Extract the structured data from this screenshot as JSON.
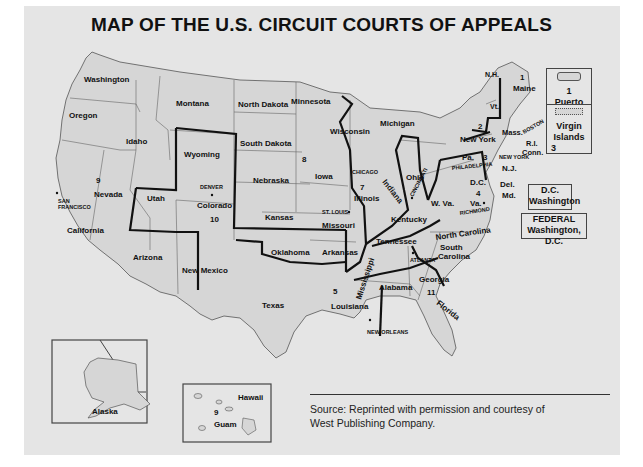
{
  "title": "MAP OF THE U.S. CIRCUIT COURTS OF APPEALS",
  "colors": {
    "background": "#e5e5e5",
    "state_fill": "#d6d6d6",
    "circuit_border": "#111111",
    "state_border": "#555555"
  },
  "states": [
    {
      "name": "Washington",
      "circuit": "9"
    },
    {
      "name": "Oregon",
      "circuit": "9"
    },
    {
      "name": "Idaho",
      "circuit": "9"
    },
    {
      "name": "Montana",
      "circuit": "9"
    },
    {
      "name": "Nevada",
      "circuit": "9"
    },
    {
      "name": "California",
      "circuit": "9"
    },
    {
      "name": "Arizona",
      "circuit": "9"
    },
    {
      "name": "Alaska",
      "circuit": "9"
    },
    {
      "name": "Hawaii",
      "circuit": "9"
    },
    {
      "name": "Guam",
      "circuit": "9"
    },
    {
      "name": "Wyoming",
      "circuit": "10"
    },
    {
      "name": "Utah",
      "circuit": "10"
    },
    {
      "name": "Colorado",
      "circuit": "10"
    },
    {
      "name": "Kansas",
      "circuit": "10"
    },
    {
      "name": "Oklahoma",
      "circuit": "10"
    },
    {
      "name": "New Mexico",
      "circuit": "10"
    },
    {
      "name": "North Dakota",
      "circuit": "8"
    },
    {
      "name": "South Dakota",
      "circuit": "8"
    },
    {
      "name": "Nebraska",
      "circuit": "8"
    },
    {
      "name": "Minnesota",
      "circuit": "8"
    },
    {
      "name": "Iowa",
      "circuit": "8"
    },
    {
      "name": "Missouri",
      "circuit": "8"
    },
    {
      "name": "Arkansas",
      "circuit": "8"
    },
    {
      "name": "Texas",
      "circuit": "5"
    },
    {
      "name": "Louisiana",
      "circuit": "5"
    },
    {
      "name": "Mississippi",
      "circuit": "5"
    },
    {
      "name": "Wisconsin",
      "circuit": "7"
    },
    {
      "name": "Illinois",
      "circuit": "7"
    },
    {
      "name": "Indiana",
      "circuit": "7"
    },
    {
      "name": "Michigan",
      "circuit": "6"
    },
    {
      "name": "Ohio",
      "circuit": "6"
    },
    {
      "name": "Kentucky",
      "circuit": "6"
    },
    {
      "name": "Tennessee",
      "circuit": "6"
    },
    {
      "name": "Alabama",
      "circuit": "11"
    },
    {
      "name": "Georgia",
      "circuit": "11"
    },
    {
      "name": "Florida",
      "circuit": "11"
    },
    {
      "name": "W. Va.",
      "circuit": "4"
    },
    {
      "name": "Va.",
      "circuit": "4"
    },
    {
      "name": "Md.",
      "circuit": "4"
    },
    {
      "name": "North Carolina",
      "circuit": "4"
    },
    {
      "name": "South Carolina",
      "circuit": "4"
    },
    {
      "name": "Pa.",
      "circuit": "3"
    },
    {
      "name": "N.J.",
      "circuit": "3"
    },
    {
      "name": "Del.",
      "circuit": "3"
    },
    {
      "name": "Virgin Islands",
      "circuit": "3"
    },
    {
      "name": "New York",
      "circuit": "2"
    },
    {
      "name": "Vt.",
      "circuit": "2"
    },
    {
      "name": "Conn.",
      "circuit": "2"
    },
    {
      "name": "Maine",
      "circuit": "1"
    },
    {
      "name": "N.H.",
      "circuit": "1"
    },
    {
      "name": "Mass.",
      "circuit": "1"
    },
    {
      "name": "R.I.",
      "circuit": "1"
    },
    {
      "name": "Puerto Rico",
      "circuit": "1"
    }
  ],
  "labels": {
    "washington": "Washington",
    "oregon": "Oregon",
    "idaho": "Idaho",
    "montana": "Montana",
    "wyoming": "Wyoming",
    "nevada": "Nevada",
    "california": "California",
    "utah": "Utah",
    "colorado": "Colorado",
    "arizona": "Arizona",
    "new_mexico": "New Mexico",
    "north_dakota": "North Dakota",
    "south_dakota": "South Dakota",
    "nebraska": "Nebraska",
    "kansas": "Kansas",
    "oklahoma": "Oklahoma",
    "texas": "Texas",
    "minnesota": "Minnesota",
    "iowa": "Iowa",
    "missouri": "Missouri",
    "arkansas": "Arkansas",
    "louisiana": "Louisiana",
    "mississippi": "Mississippi",
    "wisconsin": "Wisconsin",
    "illinois": "Illinois",
    "indiana": "Indiana",
    "michigan": "Michigan",
    "ohio": "Ohio",
    "kentucky": "Kentucky",
    "tennessee": "Tennessee",
    "alabama": "Alabama",
    "georgia": "Georgia",
    "florida": "Florida",
    "south_carolina_1": "South",
    "south_carolina_2": "Carolina",
    "north_carolina": "North Carolina",
    "w_va": "W. Va.",
    "va": "Va.",
    "md": "Md.",
    "del": "Del.",
    "dc": "D.C.",
    "nj": "N.J.",
    "pa": "Pa.",
    "new_york": "New York",
    "vt": "Vt.",
    "nh": "N.H.",
    "maine": "Maine",
    "mass": "Mass.",
    "ri": "R.I.",
    "conn": "Conn.",
    "alaska": "Alaska",
    "hawaii": "Hawaii",
    "guam": "Guam"
  },
  "circuits": {
    "c1": "1",
    "c1_pr": "1",
    "c2": "2",
    "c3": "3",
    "c3_vi": "3",
    "c4": "4",
    "c5": "5",
    "c7": "7",
    "c8": "8",
    "c9": "9",
    "c9_hi": "9",
    "c10": "10",
    "c11": "11"
  },
  "cities": {
    "san_francisco_1": "SAN",
    "san_francisco_2": "FRANCISCO",
    "denver": "DENVER",
    "chicago": "CHICAGO",
    "st_louis": "ST. LOUIS",
    "cincinnati": "CINCINNATI",
    "philadelphia": "PHILADELPHIA",
    "new_york": "NEW YORK",
    "boston": "BOSTON",
    "richmond": "RICHMOND",
    "atlanta": "ATLANTA",
    "new_orleans": "NEW ORLEANS"
  },
  "boxes": {
    "puerto_rico": {
      "number": "1",
      "label": "Puerto Rico"
    },
    "virgin_islands": {
      "label_1": "Virgin",
      "label_2": "Islands",
      "number": "3"
    },
    "dc_circuit": {
      "line1": "D.C.",
      "line2": "Washington"
    },
    "federal_circuit": {
      "line1": "FEDERAL",
      "line2": "Washington, D.C."
    }
  },
  "source": {
    "line1": "Source: Reprinted with permission and courtesy of",
    "line2": "West Publishing Company."
  }
}
